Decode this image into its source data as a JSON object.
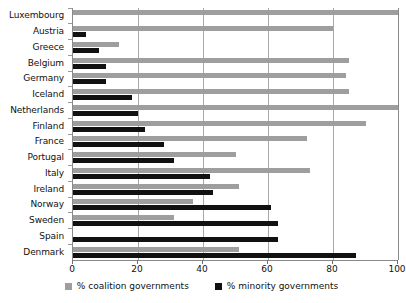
{
  "chart_data": {
    "type": "bar",
    "orientation": "horizontal",
    "title": "",
    "subtitle": "",
    "xlabel": "",
    "ylabel": "",
    "xlim": [
      0,
      100
    ],
    "xticks": [
      0,
      20,
      40,
      60,
      80,
      100
    ],
    "xtick_labels": [
      "0",
      "20",
      "40",
      "60",
      "80",
      "100"
    ],
    "grid": true,
    "grid_axis": "x",
    "legend_position": "bottom",
    "categories": [
      "Luxembourg",
      "Austria",
      "Greece",
      "Belgium",
      "Germany",
      "Iceland",
      "Netherlands",
      "Finland",
      "France",
      "Portugal",
      "Italy",
      "Ireland",
      "Norway",
      "Sweden",
      "Spain",
      "Denmark"
    ],
    "series": [
      {
        "name": "% coalition governments",
        "color": "#9e9e9e",
        "values": [
          100,
          80,
          14,
          85,
          84,
          85,
          100,
          90,
          72,
          50,
          73,
          51,
          37,
          31,
          0,
          51
        ]
      },
      {
        "name": "% minority governments",
        "color": "#111111",
        "values": [
          0,
          4,
          8,
          10,
          10,
          18,
          20,
          22,
          28,
          31,
          42,
          43,
          61,
          63,
          63,
          87
        ]
      }
    ]
  },
  "legend": {
    "items": [
      {
        "label": "% coalition governments",
        "swatch": "coalition"
      },
      {
        "label": "% minority governments",
        "swatch": "minority"
      }
    ]
  }
}
